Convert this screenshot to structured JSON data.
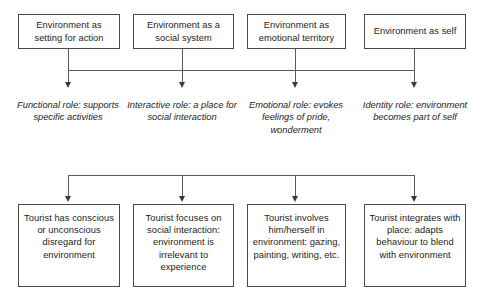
{
  "diagram": {
    "colors": {
      "box_border": "#4a4a4a",
      "connector": "#5a5a5a",
      "arrow": "#3a3a3a",
      "text": "#1c1c1c",
      "background": "#ffffff"
    },
    "columns": [
      {
        "id": "setting-for-action",
        "top_box": "Environment as setting for action",
        "role_label": "Functional role: supports specific activities",
        "bottom_box": "Tourist has conscious or unconscious disregard for environment"
      },
      {
        "id": "social-system",
        "top_box": "Environment as a social system",
        "role_label": "Interactive role: a place for social interaction",
        "bottom_box": "Tourist focuses on social interaction: environment is irrelevant to experience"
      },
      {
        "id": "emotional-territory",
        "top_box": "Environment as emotional territory",
        "role_label": "Emotional role: evokes feelings of pride, wonderment",
        "bottom_box": "Tourist involves him/herself in environment: gazing, painting, writing, etc."
      },
      {
        "id": "self",
        "top_box": "Environment as self",
        "role_label": "Identity role: environment becomes part of self",
        "bottom_box": "Tourist integrates with place: adapts behaviour to blend with environment"
      }
    ]
  }
}
